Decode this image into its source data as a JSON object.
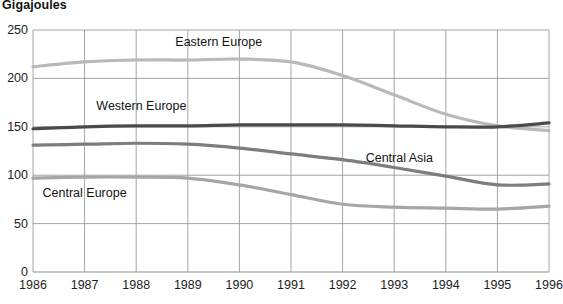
{
  "chart_data": {
    "type": "line",
    "title": "Gigajoules",
    "xlabel": "",
    "ylabel": "Gigajoules",
    "x": [
      1986,
      1987,
      1988,
      1989,
      1990,
      1991,
      1992,
      1993,
      1994,
      1995,
      1996
    ],
    "categories": [
      "1986",
      "1987",
      "1988",
      "1989",
      "1990",
      "1991",
      "1992",
      "1993",
      "1994",
      "1995",
      "1996"
    ],
    "ylim": [
      0,
      250
    ],
    "yticks": [
      0,
      50,
      100,
      150,
      200,
      250
    ],
    "ytick_labels": [
      "0",
      "50",
      "100",
      "150",
      "200",
      "250"
    ],
    "grid": true,
    "legend_position": "inline-annotations",
    "series": [
      {
        "name": "Eastern Europe",
        "color": "#b9b9b9",
        "values": [
          212,
          217,
          219,
          219,
          220,
          217,
          203,
          183,
          163,
          151,
          146
        ],
        "label_x": 1989.6,
        "label_y": 238
      },
      {
        "name": "Western Europe",
        "color": "#4a4a4a",
        "values": [
          148,
          150,
          151,
          151,
          152,
          152,
          152,
          151,
          150,
          150,
          154
        ],
        "label_x": 1988.1,
        "label_y": 172
      },
      {
        "name": "Central Asia",
        "color": "#7d7d7d",
        "values": [
          131,
          132,
          133,
          132,
          128,
          122,
          116,
          108,
          99,
          90,
          91
        ],
        "label_x": 1993.1,
        "label_y": 118
      },
      {
        "name": "Central Europe",
        "color": "#a6a6a6",
        "values": [
          97,
          98,
          98,
          97,
          90,
          80,
          70,
          67,
          66,
          65,
          68
        ],
        "label_x": 1987.0,
        "label_y": 82
      }
    ]
  }
}
